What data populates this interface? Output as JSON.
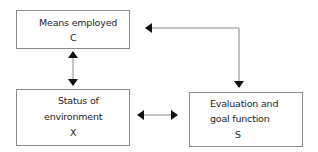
{
  "diagram": {
    "nodes": [
      {
        "id": "C",
        "label_line1": "Means employed",
        "label_line2": "C"
      },
      {
        "id": "X",
        "label_line1": "Status of",
        "label_line2": "environment",
        "label_line3": "X"
      },
      {
        "id": "S",
        "label_line1": "Evaluation and",
        "label_line2": "goal function",
        "label_line3": "S"
      }
    ],
    "edges": [
      {
        "from": "C",
        "to": "X",
        "type": "bidirectional"
      },
      {
        "from": "X",
        "to": "S",
        "type": "bidirectional"
      },
      {
        "from": "S",
        "to": "C",
        "type": "bidirectional-elbow"
      }
    ],
    "colors": {
      "line": "#8a8a8a",
      "arrowhead": "#111111"
    }
  }
}
